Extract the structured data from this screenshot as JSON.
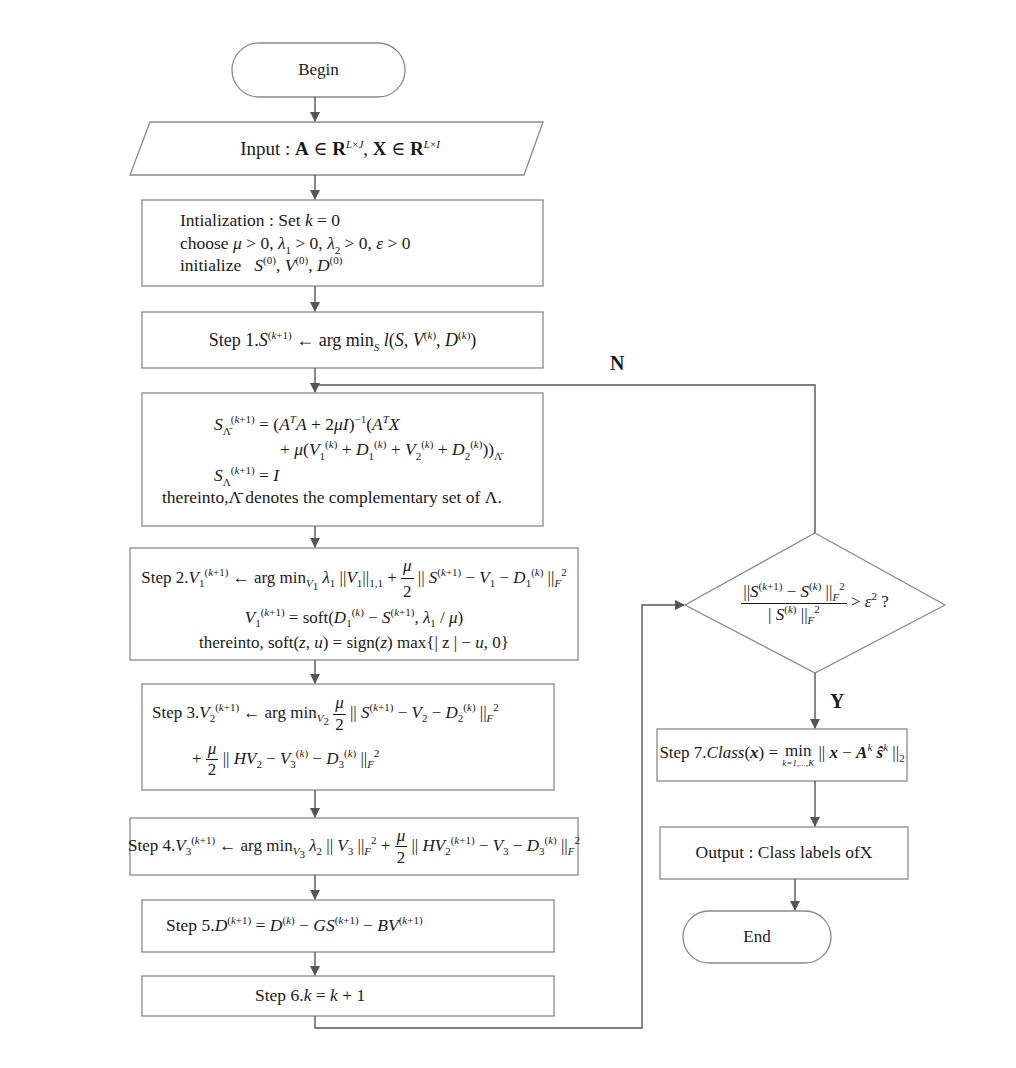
{
  "diagram": {
    "type": "flowchart",
    "title": "",
    "nodes": {
      "begin": {
        "shape": "terminal",
        "label": "Begin"
      },
      "input": {
        "shape": "parallelogram",
        "prefix": "Input : ",
        "text": "A ∈ R^{L×J}, X ∈ R^{L×I}"
      },
      "init": {
        "shape": "process",
        "lines": [
          "Intialization : Set k = 0",
          "choose μ > 0, λ1 > 0, λ2 > 0, ε > 0",
          "initialize  S(0), V(0), D(0)"
        ]
      },
      "step1": {
        "shape": "process",
        "label": "Step 1.",
        "text": "S(k+1) ← arg min_S l(S, V(k), D(k))"
      },
      "s_update": {
        "shape": "process",
        "lines": [
          "S_Λ̄(k+1) = (AᵀA + 2μI)⁻¹(AᵀX",
          "+ μ(V1(k) + D1(k) + V2(k) + D2(k)))_Λ̄",
          "S_Λ(k+1) = I",
          "thereinto, Λ̄ denotes the complementary set of Λ."
        ],
        "note_prefix": "thereinto,",
        "note_text": "denotes the complementary set of Λ."
      },
      "step2": {
        "shape": "process",
        "label": "Step 2.",
        "lines": [
          "V1(k+1) ← arg min_V1 λ1 ||V1||_1,1 + μ/2 ||S(k+1) − V1 − D1(k)||_F²",
          "V1(k+1) = soft(D1(k) − S(k+1), λ1 / μ)",
          "thereinto, soft(z,u) = sign(z) max{|z| − u, 0}"
        ],
        "soft": "soft",
        "thereinto": "thereinto,",
        "sign": "sign",
        "max": "max"
      },
      "step3": {
        "shape": "process",
        "label": "Step 3.",
        "lines": [
          "V2(k+1) ← arg min_V2 μ/2 ||S(k+1) − V2 − D2(k)||_F²",
          "+ μ/2 ||HV2 − V3(k) − D3(k)||_F²"
        ]
      },
      "step4": {
        "shape": "process",
        "label": "Step 4.",
        "text": "V3(k+1) ← arg min_V3 λ2 ||V3||_F² + μ/2 ||HV2(k+1) − V3 − D3(k)||_F²"
      },
      "step5": {
        "shape": "process",
        "label": "Step 5.",
        "text": "D(k+1) = D(k) − GS(k+1) − BV(k+1)"
      },
      "step6": {
        "shape": "process",
        "label": "Step 6.",
        "text": "k = k + 1"
      },
      "decision": {
        "shape": "diamond",
        "text": "||S(k+1) − S(k)||_F² / |S(k)||_F² > ε² ?"
      },
      "step7": {
        "shape": "process",
        "label": "Step 7.",
        "text": "Class(x) = min_{k=1,...,K} ||x − A^k ŝ^k||_2",
        "under": "k=1,...,K"
      },
      "output": {
        "shape": "process",
        "label": "Output : Class labels ofX"
      },
      "end": {
        "shape": "terminal",
        "label": "End"
      }
    },
    "edges": [
      {
        "from": "begin",
        "to": "input"
      },
      {
        "from": "input",
        "to": "init"
      },
      {
        "from": "init",
        "to": "step1"
      },
      {
        "from": "step1",
        "to": "s_update"
      },
      {
        "from": "s_update",
        "to": "step2"
      },
      {
        "from": "step2",
        "to": "step3"
      },
      {
        "from": "step3",
        "to": "step4"
      },
      {
        "from": "step4",
        "to": "step5"
      },
      {
        "from": "step5",
        "to": "step6"
      },
      {
        "from": "step6",
        "to": "decision"
      },
      {
        "from": "decision",
        "to": "s_update",
        "label": "N"
      },
      {
        "from": "decision",
        "to": "step7",
        "label": "Y"
      },
      {
        "from": "step7",
        "to": "output"
      },
      {
        "from": "output",
        "to": "end"
      }
    ],
    "branch_labels": {
      "no": "N",
      "yes": "Y"
    },
    "colors": {
      "stroke": "#8a8a8a",
      "arrow": "#555555",
      "text": "#1a1a1a",
      "background": "#ffffff"
    }
  }
}
